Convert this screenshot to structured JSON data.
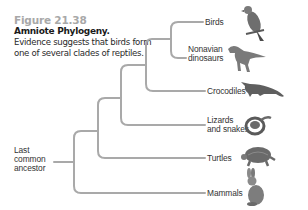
{
  "figure": {
    "number": "Figure 21.38",
    "title": "Amniote Phylogeny.",
    "description": "Evidence suggests that birds form one of several clades of reptiles."
  },
  "tree": {
    "root_label": "Last common ancestor",
    "root_label_lines": [
      "Last",
      "common",
      "ancestor"
    ],
    "line_color": "#a9a9a9",
    "taxa": [
      {
        "name": "Birds",
        "lines": [
          "Birds"
        ],
        "icon": "bird-icon"
      },
      {
        "name": "Nonavian dinosaurs",
        "lines": [
          "Nonavian",
          "dinosaurs"
        ],
        "icon": "dinosaur-icon"
      },
      {
        "name": "Crocodiles",
        "lines": [
          "Crocodiles"
        ],
        "icon": "crocodile-icon"
      },
      {
        "name": "Lizards and snakes",
        "lines": [
          "Lizards",
          "and snakes"
        ],
        "icon": "snake-icon"
      },
      {
        "name": "Turtles",
        "lines": [
          "Turtles"
        ],
        "icon": "turtle-icon"
      },
      {
        "name": "Mammals",
        "lines": [
          "Mammals"
        ],
        "icon": "rabbit-icon"
      }
    ]
  }
}
